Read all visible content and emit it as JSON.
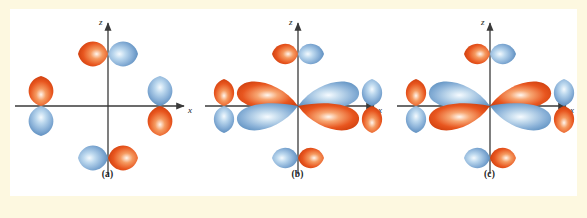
{
  "figure": {
    "background_color": "#fdf8e0",
    "canvas_color": "#ffffff",
    "lobe_positive_color": "#e8561f",
    "lobe_negative_color": "#7fa8d4",
    "axis_color": "#3a3a3a"
  },
  "panels": [
    {
      "id": "a",
      "caption": "(a)",
      "axis_z_label": "z",
      "axis_x_label": "x",
      "center_orbital": null,
      "outer_lobes": [
        {
          "name": "top",
          "orientation": "horizontal",
          "first_color": "orange",
          "second_color": "blue"
        },
        {
          "name": "bottom",
          "orientation": "horizontal",
          "first_color": "blue",
          "second_color": "orange"
        },
        {
          "name": "left",
          "orientation": "vertical",
          "first_color": "orange",
          "second_color": "blue"
        },
        {
          "name": "right",
          "orientation": "vertical",
          "first_color": "blue",
          "second_color": "orange"
        }
      ]
    },
    {
      "id": "b",
      "caption": "(b)",
      "axis_z_label": "z",
      "axis_x_label": "x",
      "center_orbital": {
        "type": "four-lobe",
        "upper_left": "orange",
        "upper_right": "blue",
        "lower_left": "blue",
        "lower_right": "orange"
      },
      "outer_lobes": [
        {
          "name": "top",
          "orientation": "horizontal",
          "first_color": "orange",
          "second_color": "blue"
        },
        {
          "name": "bottom",
          "orientation": "horizontal",
          "first_color": "blue",
          "second_color": "orange"
        },
        {
          "name": "left",
          "orientation": "vertical",
          "first_color": "orange",
          "second_color": "blue"
        },
        {
          "name": "right",
          "orientation": "vertical",
          "first_color": "blue",
          "second_color": "orange"
        }
      ]
    },
    {
      "id": "c",
      "caption": "(c)",
      "axis_z_label": "z",
      "axis_x_label": "x",
      "center_orbital": {
        "type": "four-lobe",
        "upper_left": "blue",
        "upper_right": "orange",
        "lower_left": "orange",
        "lower_right": "blue"
      },
      "outer_lobes": [
        {
          "name": "top",
          "orientation": "horizontal",
          "first_color": "orange",
          "second_color": "blue"
        },
        {
          "name": "bottom",
          "orientation": "horizontal",
          "first_color": "blue",
          "second_color": "orange"
        },
        {
          "name": "left",
          "orientation": "vertical",
          "first_color": "orange",
          "second_color": "blue"
        },
        {
          "name": "right",
          "orientation": "vertical",
          "first_color": "blue",
          "second_color": "orange"
        }
      ]
    }
  ]
}
